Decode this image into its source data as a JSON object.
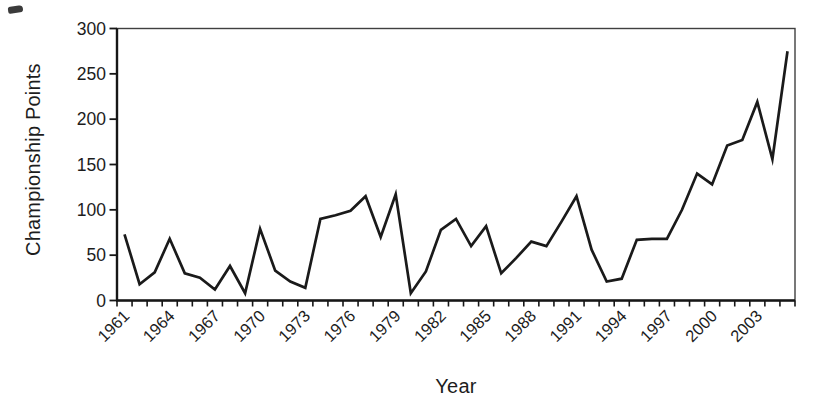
{
  "figure": {
    "background": "#ffffff",
    "line_color": "#1a1a1a",
    "axis_color": "#161616",
    "frame_color": "#3f3f3f",
    "text_color": "#1c1c1c"
  },
  "chart_data": {
    "type": "line",
    "title": "",
    "xlabel": "Year",
    "ylabel": "Championship Points",
    "x": [
      1961,
      1962,
      1963,
      1964,
      1965,
      1966,
      1967,
      1968,
      1969,
      1970,
      1971,
      1972,
      1973,
      1974,
      1975,
      1976,
      1977,
      1978,
      1979,
      1980,
      1981,
      1982,
      1983,
      1984,
      1985,
      1986,
      1987,
      1988,
      1989,
      1990,
      1991,
      1992,
      1993,
      1994,
      1995,
      1996,
      1997,
      1998,
      1999,
      2000,
      2001,
      2002,
      2003,
      2004,
      2005
    ],
    "values": [
      73,
      18,
      31,
      68,
      30,
      25,
      12,
      38,
      8,
      79,
      33,
      21,
      14,
      90,
      94,
      99,
      115,
      70,
      117,
      8,
      32,
      78,
      90,
      60,
      82,
      30,
      47,
      65,
      60,
      87,
      115,
      56,
      21,
      24,
      67,
      68,
      68,
      100,
      140,
      128,
      171,
      177,
      219,
      156,
      275
    ],
    "yticks": [
      0,
      50,
      100,
      150,
      200,
      250,
      300
    ],
    "ylim": [
      0,
      300
    ],
    "xtick_labels": [
      "1961",
      "1964",
      "1967",
      "1970",
      "1973",
      "1976",
      "1979",
      "1982",
      "1985",
      "1988",
      "1991",
      "1994",
      "1997",
      "2000",
      "2003"
    ],
    "xtick_label_step": 3,
    "xtick_label_rotation": -45,
    "grid": "off",
    "legend": "none",
    "series_name": "Championship Points by Year"
  }
}
